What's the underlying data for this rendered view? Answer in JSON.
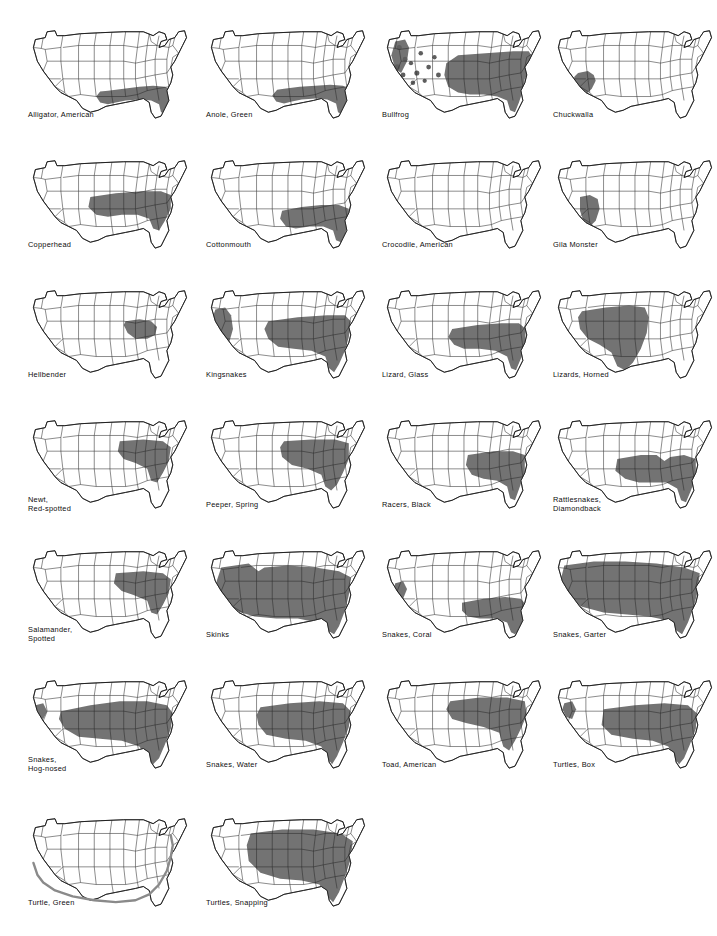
{
  "figure": {
    "columns": 4,
    "rows": 7,
    "map_count": 26,
    "base_map": "United States (48 contiguous states) outline with state boundaries",
    "legend_note": "Shaded gray area indicates species range",
    "colors": {
      "range_shade": "#737373",
      "range_shade_dark": "#5e5e5e",
      "outline": "#111111",
      "state_line": "#2b2b2b",
      "background": "#ffffff",
      "coastal_band": "#8a8a8a"
    }
  },
  "maps": [
    {
      "id": "alligator-american",
      "label": "Alligator, American",
      "lines": 1,
      "col": 0,
      "row": 0
    },
    {
      "id": "anole-green",
      "label": "Anole, Green",
      "lines": 1,
      "col": 1,
      "row": 0
    },
    {
      "id": "bullfrog",
      "label": "Bullfrog",
      "lines": 1,
      "col": 2,
      "row": 0
    },
    {
      "id": "chuckwalla",
      "label": "Chuckwalla",
      "lines": 1,
      "col": 3,
      "row": 0
    },
    {
      "id": "copperhead",
      "label": "Copperhead",
      "lines": 1,
      "col": 0,
      "row": 1
    },
    {
      "id": "cottonmouth",
      "label": "Cottonmouth",
      "lines": 1,
      "col": 1,
      "row": 1
    },
    {
      "id": "crocodile-american",
      "label": "Crocodile, American",
      "lines": 1,
      "col": 2,
      "row": 1
    },
    {
      "id": "gila-monster",
      "label": "Gila Monster",
      "lines": 1,
      "col": 3,
      "row": 1
    },
    {
      "id": "hellbender",
      "label": "Hellbender",
      "lines": 1,
      "col": 0,
      "row": 2
    },
    {
      "id": "kingsnakes",
      "label": "Kingsnakes",
      "lines": 1,
      "col": 1,
      "row": 2
    },
    {
      "id": "lizard-glass",
      "label": "Lizard, Glass",
      "lines": 1,
      "col": 2,
      "row": 2
    },
    {
      "id": "lizards-horned",
      "label": "Lizards, Horned",
      "lines": 1,
      "col": 3,
      "row": 2
    },
    {
      "id": "newt-red-spotted",
      "label": "Newt,\nRed-spotted",
      "lines": 2,
      "col": 0,
      "row": 3
    },
    {
      "id": "peeper-spring",
      "label": "Peeper, Spring",
      "lines": 1,
      "col": 1,
      "row": 3
    },
    {
      "id": "racers-black",
      "label": "Racers, Black",
      "lines": 1,
      "col": 2,
      "row": 3
    },
    {
      "id": "rattlesnakes-diamondback",
      "label": "Rattlesnakes,\nDiamondback",
      "lines": 2,
      "col": 3,
      "row": 3
    },
    {
      "id": "salamander-spotted",
      "label": "Salamander,\nSpotted",
      "lines": 2,
      "col": 0,
      "row": 4
    },
    {
      "id": "skinks",
      "label": "Skinks",
      "lines": 1,
      "col": 1,
      "row": 4
    },
    {
      "id": "snakes-coral",
      "label": "Snakes, Coral",
      "lines": 1,
      "col": 2,
      "row": 4
    },
    {
      "id": "snakes-garter",
      "label": "Snakes, Garter",
      "lines": 1,
      "col": 3,
      "row": 4
    },
    {
      "id": "snakes-hog-nosed",
      "label": "Snakes,\nHog-nosed",
      "lines": 2,
      "col": 0,
      "row": 5
    },
    {
      "id": "snakes-water",
      "label": "Snakes, Water",
      "lines": 1,
      "col": 1,
      "row": 5
    },
    {
      "id": "toad-american",
      "label": "Toad, American",
      "lines": 1,
      "col": 2,
      "row": 5
    },
    {
      "id": "turtles-box",
      "label": "Turtles, Box",
      "lines": 1,
      "col": 3,
      "row": 5
    },
    {
      "id": "turtle-green",
      "label": "Turtle, Green",
      "lines": 1,
      "col": 0,
      "row": 6
    },
    {
      "id": "turtles-snapping",
      "label": "Turtles, Snapping",
      "lines": 1,
      "col": 1,
      "row": 6
    }
  ],
  "range_shapes": {
    "alligator-american": [
      "M 88 74 L 104 72 L 120 70 L 134 69 L 146 70 L 152 73 L 152 82 L 148 90 L 146 97 L 142 96 L 140 88 L 132 84 L 120 83 L 106 84 L 96 86 L 88 88 L 80 86 L 76 80 L 80 75 Z"
    ],
    "anole-green": [
      "M 86 72 L 102 70 L 118 69 L 133 68 L 146 69 L 152 72 L 152 83 L 148 91 L 145 98 L 141 96 L 139 87 L 130 83 L 118 82 L 104 83 L 94 85 L 86 87 L 78 85 L 74 79 L 79 73 Z"
    ],
    "bullfrog": [
      "M 84 38 L 112 36 L 140 34 L 156 34 L 160 40 L 158 52 L 152 62 L 150 74 L 146 86 L 142 96 L 137 94 L 134 84 L 124 80 L 110 78 L 96 78 L 84 76 L 74 70 L 70 58 L 72 46 Z",
      "M 20 24 L 30 22 L 34 30 L 32 44 L 26 56 L 20 52 L 16 38 Z"
    ],
    "chuckwalla": [
      "M 32 56 L 42 54 L 48 58 L 50 64 L 46 72 L 40 78 L 34 76 L 30 68 L 28 60 Z"
    ],
    "copperhead": [
      "M 70 50 L 96 46 L 122 44 L 142 44 L 152 48 L 152 62 L 146 74 L 140 84 L 134 82 L 130 72 L 118 68 L 102 68 L 88 70 L 76 68 L 68 60 Z"
    ],
    "cottonmouth": [
      "M 84 64 L 104 60 L 124 58 L 142 58 L 152 62 L 152 76 L 148 88 L 144 96 L 139 94 L 136 84 L 126 80 L 112 80 L 98 82 L 88 80 L 82 72 Z"
    ],
    "crocodile-american": [
      "M 148 94 L 152 92 L 153 98 L 150 100 Z"
    ],
    "gila-monster": [
      "M 34 50 L 44 48 L 52 52 L 54 62 L 50 74 L 44 80 L 38 76 L 34 64 Z"
    ],
    "hellbender": [
      "M 106 44 L 120 42 L 132 44 L 138 50 L 136 58 L 128 62 L 116 62 L 108 56 L 104 48 Z"
    ],
    "kingsnakes": [
      "M 70 44 L 100 40 L 130 38 L 148 38 L 154 44 L 152 60 L 148 74 L 142 88 L 137 96 L 132 92 L 128 80 L 114 74 L 96 72 L 80 70 L 70 62 L 66 52 Z",
      "M 16 32 L 26 30 L 32 38 L 34 52 L 30 66 L 24 74 L 18 68 L 14 52 L 14 38 Z"
    ],
    "lizard-glass": [
      "M 78 52 L 104 48 L 128 46 L 146 46 L 153 52 L 152 68 L 148 82 L 143 94 L 138 92 L 134 80 L 122 74 L 106 72 L 90 72 L 80 68 L 74 60 Z"
    ],
    "lizards-horned": [
      "M 36 34 L 60 30 L 84 28 L 100 30 L 104 40 L 102 56 L 96 72 L 88 86 L 80 94 L 72 90 L 66 76 L 54 68 L 42 62 L 34 52 L 32 40 Z"
    ],
    "newt-red-spotted": [
      "M 100 34 L 124 32 L 144 34 L 152 40 L 150 54 L 144 66 L 138 76 L 132 74 L 128 62 L 116 56 L 104 52 L 98 44 Z"
    ],
    "peeper-spring": [
      "M 86 34 L 114 32 L 138 32 L 152 36 L 152 52 L 146 66 L 140 78 L 134 84 L 128 80 L 124 68 L 110 62 L 94 58 L 84 50 L 82 40 Z"
    ],
    "racers-black": [
      "M 94 48 L 120 44 L 140 44 L 152 48 L 152 66 L 147 80 L 142 94 L 137 92 L 134 80 L 124 74 L 110 72 L 98 68 L 92 58 Z"
    ],
    "rattlesnakes-diamondback": [
      "M 72 52 L 96 48 L 112 48 L 120 54 L 126 50 L 140 48 L 152 52 L 152 70 L 147 84 L 142 96 L 137 94 L 133 82 L 122 76 L 108 76 L 94 76 L 80 72 L 70 64 Z"
    ],
    "salamander-spotted": [
      "M 96 36 L 124 34 L 144 36 L 152 42 L 150 56 L 144 68 L 138 78 L 132 76 L 128 64 L 114 58 L 102 54 L 94 46 Z"
    ],
    "skinks": [
      "M 22 30 L 50 26 L 60 34 L 66 30 L 90 28 L 118 30 L 142 34 L 154 40 L 152 58 L 148 74 L 142 90 L 137 98 L 130 94 L 120 86 L 100 82 L 78 82 L 56 80 L 36 74 L 22 64 L 16 48 Z"
    ],
    "snakes-coral": [
      "M 88 66 L 110 62 L 132 60 L 148 62 L 153 68 L 152 80 L 147 92 L 142 98 L 138 96 L 134 86 L 122 82 L 106 82 L 94 80 L 88 74 Z",
      "M 20 46 L 28 44 L 32 52 L 28 62 L 22 62 L 18 54 Z"
    ],
    "snakes-garter": [
      "M 18 28 L 48 24 L 80 24 L 112 26 L 140 30 L 156 36 L 154 54 L 150 70 L 144 86 L 138 98 L 132 94 L 124 84 L 104 80 L 82 78 L 58 76 L 36 70 L 20 60 L 14 44 Z"
    ],
    "snakes-hog-nosed": [
      "M 40 44 L 70 38 L 100 34 L 128 34 L 148 38 L 154 46 L 152 62 L 146 78 L 140 92 L 134 98 L 128 92 L 120 80 L 102 74 L 80 72 L 58 70 L 44 62 L 38 52 Z",
      "M 14 38 L 22 36 L 26 44 L 22 52 L 16 50 L 12 44 Z"
    ],
    "snakes-water": [
      "M 62 40 L 92 36 L 122 34 L 146 36 L 154 44 L 152 60 L 146 76 L 140 90 L 135 98 L 130 92 L 124 80 L 108 74 L 88 72 L 68 68 L 60 58 L 58 48 Z"
    ],
    "toad-american": [
      "M 76 34 L 106 30 L 134 30 L 152 34 L 154 48 L 148 62 L 142 74 L 136 84 L 130 80 L 126 66 L 110 60 L 92 56 L 78 52 L 72 42 Z"
    ],
    "turtles-box": [
      "M 58 42 L 90 38 L 120 36 L 144 38 L 153 46 L 152 62 L 146 78 L 140 92 L 135 98 L 130 92 L 124 80 L 108 74 L 88 72 L 66 68 L 56 58 Z",
      "M 18 36 L 26 34 L 30 42 L 26 52 L 20 50 L 16 42 Z"
    ],
    "turtle-green": [],
    "turtles-snapping": [
      "M 52 28 L 84 24 L 116 24 L 144 28 L 156 36 L 154 54 L 148 72 L 142 88 L 136 98 L 130 92 L 122 80 L 104 76 L 82 74 L 62 68 L 50 56 L 48 40 Z"
    ]
  },
  "bullfrog_dots": [
    {
      "cx": 24,
      "cy": 30,
      "r": 2.6
    },
    {
      "cx": 30,
      "cy": 42,
      "r": 2.4
    },
    {
      "cx": 22,
      "cy": 50,
      "r": 2.8
    },
    {
      "cx": 28,
      "cy": 58,
      "r": 2.4
    },
    {
      "cx": 36,
      "cy": 46,
      "r": 2.2
    },
    {
      "cx": 42,
      "cy": 56,
      "r": 2.6
    },
    {
      "cx": 46,
      "cy": 36,
      "r": 2.3
    },
    {
      "cx": 54,
      "cy": 50,
      "r": 2.4
    },
    {
      "cx": 60,
      "cy": 40,
      "r": 2.2
    },
    {
      "cx": 64,
      "cy": 58,
      "r": 2.5
    },
    {
      "cx": 38,
      "cy": 66,
      "r": 2.3
    },
    {
      "cx": 50,
      "cy": 64,
      "r": 2.2
    }
  ],
  "turtle_green_coast": "M 12 58 L 16 70 L 22 78 L 34 86 L 52 92 L 74 96 L 96 98 L 116 96 L 130 90 L 140 80 L 148 66 L 152 52 L 154 40 L 152 30"
}
